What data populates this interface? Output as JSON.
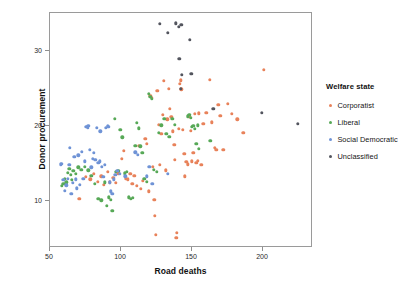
{
  "chart_data": {
    "type": "scatter",
    "title": "",
    "xlabel": "Road deaths",
    "ylabel": "Donor procurement",
    "xlim": [
      45,
      231
    ],
    "ylim": [
      4.2,
      34.5
    ],
    "xticks": [
      50,
      100,
      150,
      200
    ],
    "yticks": [
      10,
      20,
      30
    ],
    "grid": false,
    "legend": {
      "title": "Welfare state",
      "position": "right",
      "entries": [
        {
          "name": "Corporatist",
          "color": "#e8825a"
        },
        {
          "name": "Liberal",
          "color": "#57a957"
        },
        {
          "name": "Social Democratic",
          "color": "#6f93d6"
        },
        {
          "name": "Unclassified",
          "color": "#53555e"
        }
      ]
    },
    "series": [
      {
        "name": "Corporatist",
        "color": "#e8825a",
        "points": [
          [
            70.5,
            10.3
          ],
          [
            75.0,
            13.2
          ],
          [
            78.5,
            12.9
          ],
          [
            81.0,
            13.6
          ],
          [
            83.5,
            12.6
          ],
          [
            86.0,
            13.3
          ],
          [
            88.0,
            12.2
          ],
          [
            90.5,
            13.9
          ],
          [
            92.0,
            12.5
          ],
          [
            94.5,
            13.1
          ],
          [
            96.5,
            12.4
          ],
          [
            98.0,
            13.7
          ],
          [
            100.5,
            15.6
          ],
          [
            102.0,
            16.7
          ],
          [
            103.5,
            13.0
          ],
          [
            105.0,
            12.9
          ],
          [
            106.5,
            13.6
          ],
          [
            108.0,
            12.3
          ],
          [
            109.5,
            13.4
          ],
          [
            111.0,
            12.0
          ],
          [
            112.5,
            17.4
          ],
          [
            114.0,
            11.6
          ],
          [
            115.5,
            12.7
          ],
          [
            117.0,
            18.3
          ],
          [
            118.0,
            17.6
          ],
          [
            119.5,
            11.3
          ],
          [
            120.5,
            24.0
          ],
          [
            121.5,
            23.8
          ],
          [
            122.5,
            14.6
          ],
          [
            123.5,
            10.2
          ],
          [
            124.0,
            8.0
          ],
          [
            124.5,
            5.5
          ],
          [
            125.5,
            24.7
          ],
          [
            126.5,
            20.2
          ],
          [
            127.5,
            14.8
          ],
          [
            128.5,
            19.0
          ],
          [
            129.5,
            21.5
          ],
          [
            130.0,
            26.0
          ],
          [
            131.5,
            14.1
          ],
          [
            132.5,
            20.9
          ],
          [
            133.5,
            25.0
          ],
          [
            134.5,
            22.3
          ],
          [
            135.5,
            21.2
          ],
          [
            136.5,
            19.3
          ],
          [
            137.5,
            17.5
          ],
          [
            138.0,
            15.5
          ],
          [
            139.0,
            5.1
          ],
          [
            139.5,
            5.8
          ],
          [
            140.5,
            19.6
          ],
          [
            141.5,
            25.6
          ],
          [
            142.0,
            26.1
          ],
          [
            142.5,
            24.9
          ],
          [
            143.5,
            19.5
          ],
          [
            144.5,
            16.3
          ],
          [
            145.0,
            13.3
          ],
          [
            146.0,
            15.2
          ],
          [
            147.0,
            14.9
          ],
          [
            148.0,
            21.2
          ],
          [
            149.0,
            19.4
          ],
          [
            150.0,
            15.3
          ],
          [
            151.0,
            16.4
          ],
          [
            152.0,
            21.6
          ],
          [
            153.0,
            15.1
          ],
          [
            154.0,
            15.4
          ],
          [
            155.0,
            21.7
          ],
          [
            156.5,
            14.8
          ],
          [
            158.0,
            20.3
          ],
          [
            160.0,
            21.8
          ],
          [
            162.5,
            26.2
          ],
          [
            164.0,
            20.5
          ],
          [
            166.0,
            17.1
          ],
          [
            167.0,
            16.8
          ],
          [
            168.5,
            22.8
          ],
          [
            170.0,
            21.4
          ],
          [
            172.0,
            16.8
          ],
          [
            175.0,
            23.0
          ],
          [
            178.0,
            21.6
          ],
          [
            182.0,
            20.9
          ],
          [
            186.0,
            19.1
          ],
          [
            200.5,
            27.5
          ]
        ]
      },
      {
        "name": "Liberal",
        "color": "#57a957",
        "points": [
          [
            58.5,
            12.0
          ],
          [
            59.5,
            12.3
          ],
          [
            60.5,
            13.0
          ],
          [
            61.5,
            12.5
          ],
          [
            62.5,
            13.8
          ],
          [
            63.5,
            14.3
          ],
          [
            64.5,
            13.5
          ],
          [
            65.5,
            12.8
          ],
          [
            66.5,
            14.0
          ],
          [
            68.0,
            13.6
          ],
          [
            70.0,
            14.5
          ],
          [
            72.0,
            14.2
          ],
          [
            74.5,
            14.6
          ],
          [
            77.0,
            14.1
          ],
          [
            79.0,
            13.4
          ],
          [
            81.5,
            12.3
          ],
          [
            84.0,
            10.3
          ],
          [
            86.0,
            10.1
          ],
          [
            88.5,
            12.5
          ],
          [
            90.0,
            9.4
          ],
          [
            91.5,
            10.5
          ],
          [
            93.0,
            10.2
          ],
          [
            94.0,
            8.7
          ],
          [
            95.5,
            21.0
          ],
          [
            96.5,
            13.9
          ],
          [
            98.0,
            14.0
          ],
          [
            99.5,
            19.5
          ],
          [
            101.0,
            18.5
          ],
          [
            102.5,
            13.7
          ],
          [
            104.0,
            13.9
          ],
          [
            105.5,
            10.5
          ],
          [
            107.0,
            10.3
          ],
          [
            108.5,
            10.4
          ],
          [
            110.0,
            17.4
          ],
          [
            111.0,
            20.4
          ],
          [
            112.5,
            19.7
          ],
          [
            113.5,
            17.3
          ],
          [
            115.0,
            16.4
          ],
          [
            116.5,
            13.0
          ],
          [
            118.0,
            12.6
          ],
          [
            119.5,
            24.3
          ],
          [
            120.5,
            23.9
          ],
          [
            121.5,
            23.6
          ],
          [
            123.0,
            14.2
          ],
          [
            125.0,
            13.9
          ],
          [
            126.5,
            19.1
          ],
          [
            128.5,
            20.1
          ],
          [
            130.5,
            21.0
          ],
          [
            132.0,
            19.0
          ],
          [
            134.0,
            18.6
          ],
          [
            136.0,
            21.0
          ],
          [
            138.0,
            20.2
          ],
          [
            147.0,
            21.3
          ],
          [
            148.0,
            21.5
          ],
          [
            149.0,
            21.1
          ],
          [
            150.0,
            19.9
          ],
          [
            151.0,
            20.0
          ],
          [
            152.0,
            19.6
          ],
          [
            153.0,
            17.6
          ],
          [
            154.0,
            20.1
          ],
          [
            155.0,
            17.0
          ],
          [
            163.0,
            18.0
          ]
        ]
      },
      {
        "name": "Social Democratic",
        "color": "#6f93d6",
        "points": [
          [
            57.5,
            14.9
          ],
          [
            58.5,
            15.0
          ],
          [
            59.5,
            12.8
          ],
          [
            60.5,
            11.4
          ],
          [
            61.5,
            12.1
          ],
          [
            62.5,
            13.0
          ],
          [
            63.5,
            14.8
          ],
          [
            64.0,
            17.1
          ],
          [
            65.0,
            11.0
          ],
          [
            66.0,
            12.4
          ],
          [
            67.0,
            15.9
          ],
          [
            68.0,
            12.9
          ],
          [
            69.0,
            11.7
          ],
          [
            70.0,
            16.1
          ],
          [
            71.0,
            12.2
          ],
          [
            72.5,
            16.6
          ],
          [
            73.5,
            13.0
          ],
          [
            74.5,
            15.3
          ],
          [
            75.5,
            19.9
          ],
          [
            76.5,
            19.8
          ],
          [
            77.0,
            20.0
          ],
          [
            78.0,
            16.8
          ],
          [
            79.0,
            14.5
          ],
          [
            80.0,
            15.6
          ],
          [
            81.0,
            16.4
          ],
          [
            82.0,
            15.5
          ],
          [
            83.0,
            19.8
          ],
          [
            84.0,
            15.1
          ],
          [
            85.0,
            15.3
          ],
          [
            85.5,
            19.3
          ],
          [
            86.5,
            14.6
          ],
          [
            87.5,
            13.2
          ],
          [
            88.5,
            14.8
          ],
          [
            89.5,
            19.8
          ],
          [
            90.5,
            20.0
          ],
          [
            91.0,
            19.9
          ],
          [
            92.0,
            12.5
          ],
          [
            93.0,
            11.3
          ],
          [
            94.0,
            11.0
          ],
          [
            95.0,
            12.9
          ],
          [
            96.0,
            13.5
          ],
          [
            97.5,
            14.0
          ],
          [
            99.0,
            13.6
          ],
          [
            103.0,
            13.3
          ],
          [
            110.0,
            16.5
          ],
          [
            112.0,
            16.2
          ],
          [
            118.0,
            13.3
          ],
          [
            120.0,
            14.6
          ],
          [
            122.0,
            12.3
          ],
          [
            133.0,
            13.6
          ]
        ]
      },
      {
        "name": "Unclassified",
        "color": "#53555e",
        "points": [
          [
            127.5,
            33.6
          ],
          [
            133.0,
            32.4
          ],
          [
            138.5,
            33.7
          ],
          [
            140.5,
            33.2
          ],
          [
            142.5,
            33.5
          ],
          [
            141.0,
            29.0
          ],
          [
            143.0,
            26.8
          ],
          [
            148.5,
            31.5
          ],
          [
            149.5,
            27.0
          ],
          [
            142.0,
            25.0
          ],
          [
            165.0,
            22.3
          ],
          [
            199.0,
            21.8
          ],
          [
            224.5,
            20.3
          ]
        ]
      }
    ]
  },
  "axes": {
    "xticklabels": [
      "50",
      "100",
      "150",
      "200"
    ],
    "yticklabels": [
      "10",
      "20",
      "30"
    ]
  }
}
